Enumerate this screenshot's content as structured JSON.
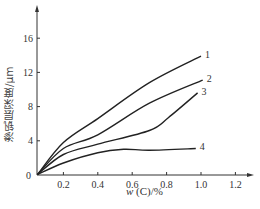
{
  "chart_data": {
    "type": "line",
    "title": "",
    "xlabel": "w (C)/%",
    "ylabel": "渗钒层深度/μm",
    "xlim": [
      0,
      1.3
    ],
    "ylim": [
      0,
      19
    ],
    "x_ticks": [
      "0.2",
      "0.4",
      "0.6",
      "0.8",
      "1.0",
      "1.2"
    ],
    "y_ticks": [
      "0",
      "4",
      "8",
      "12",
      "16"
    ],
    "origin_label": "0",
    "grid": false,
    "legend": "inline curve labels at right ends",
    "series": [
      {
        "name": "1",
        "x": [
          0.05,
          0.2,
          0.4,
          0.7,
          1.0
        ],
        "values": [
          0,
          3.8,
          6.6,
          10.8,
          13.9
        ]
      },
      {
        "name": "2",
        "x": [
          0.05,
          0.2,
          0.4,
          0.7,
          1.01
        ],
        "values": [
          0,
          3.1,
          4.7,
          8.4,
          11.1
        ]
      },
      {
        "name": "3",
        "x": [
          0.05,
          0.2,
          0.4,
          0.7,
          0.81,
          0.98
        ],
        "values": [
          0,
          2.4,
          3.6,
          5.2,
          6.7,
          9.6
        ]
      },
      {
        "name": "4",
        "x": [
          0.05,
          0.2,
          0.4,
          0.55,
          0.7,
          0.97
        ],
        "values": [
          0,
          1.4,
          2.6,
          3.0,
          2.9,
          3.1
        ]
      }
    ]
  },
  "labels": {
    "xlabel_prefix": "w",
    "xlabel_rest": " (C)/%",
    "ylabel": "渗钒层深度/μm"
  }
}
